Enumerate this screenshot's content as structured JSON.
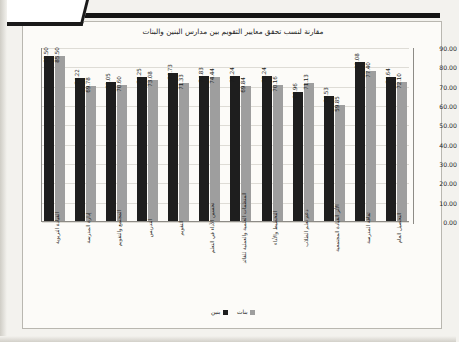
{
  "chart_data": {
    "type": "bar",
    "title": "مقارنة لنسب تحقق معايير التقويم بين مدارس البنين والبنات",
    "xlabel": "",
    "ylabel": "",
    "ylim": [
      0,
      90
    ],
    "ytick_step": 10,
    "grid": true,
    "legend_position": "bottom",
    "categories": [
      "التحصيل العام",
      "ثقافة المدرسة",
      "الأثر القيادة المجتمعية",
      "دعم تعلم الطلاب",
      "التخطيط والأداء",
      "المنظمات العلمية والعملية للقائد",
      "تحسين الأداء في التعلم",
      "التقويم",
      "التدريس",
      "المجتمع والتقويم",
      "إدارة المدرسة",
      "القيادة التربوية"
    ],
    "series": [
      {
        "name": "بنات",
        "color": "#9e9e9e",
        "values": [
          72.1,
          77.4,
          59.85,
          71.13,
          70.16,
          69.84,
          74.44,
          71.33,
          73.08,
          70.6,
          69.78,
          85.5
        ]
      },
      {
        "name": "بنين",
        "color": "#1e1e1e",
        "values": [
          74.64,
          82.08,
          64.53,
          66.96,
          75.24,
          75.24,
          74.83,
          76.73,
          74.25,
          72.05,
          74.22,
          85.5
        ]
      }
    ],
    "ytick_labels": [
      "90.00",
      "80.00",
      "70.00",
      "60.00",
      "50.00",
      "40.00",
      "30.00",
      "20.00",
      "10.00",
      "0.00"
    ],
    "value_label_format": "0.00"
  }
}
